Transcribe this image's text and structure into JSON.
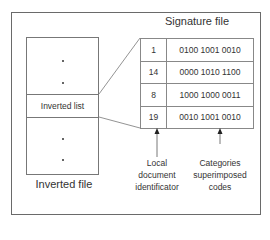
{
  "inverted_file": {
    "title": "Inverted file",
    "highlighted_entry": "Inverted list",
    "ellipsis_above": "⋮",
    "ellipsis_below": "⋮"
  },
  "signature_file": {
    "title": "Signature file",
    "rows": [
      {
        "id": "1",
        "code": "0100 1001 0010"
      },
      {
        "id": "14",
        "code": "0000 1010 1100"
      },
      {
        "id": "8",
        "code": "1000 1000 0011"
      },
      {
        "id": "19",
        "code": "0010 1001 0010"
      }
    ]
  },
  "annotations": {
    "id_column": [
      "Local",
      "document",
      "identificator"
    ],
    "code_column": [
      "Categories",
      "superimposed",
      "codes"
    ]
  }
}
